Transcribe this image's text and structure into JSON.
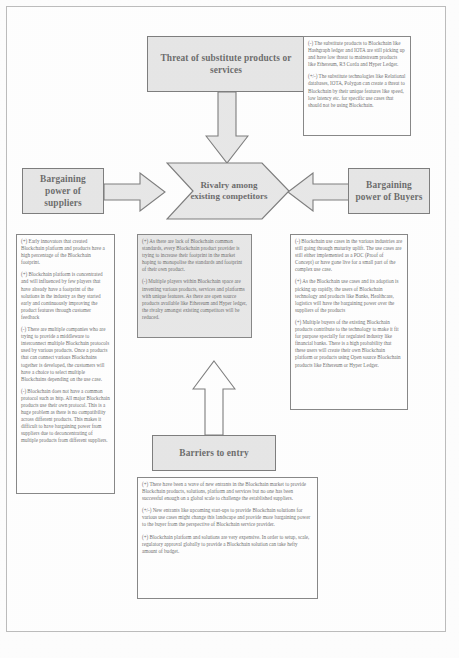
{
  "diagram": {
    "forces": {
      "substitutes": "Threat of substitute products or services",
      "suppliers": "Bargaining power of suppliers",
      "buyers": "Bargaining power of Buyers",
      "rivalry": "Rivalry among existing competitors",
      "entry": "Barriers to entry"
    },
    "colors": {
      "box_fill": "#dadada",
      "box_border": "#3b3b3b",
      "text_border": "#4a4a4a",
      "page_bg": "#ffffff"
    }
  },
  "notes": {
    "substitutes": [
      "(-) The substitute products to Blockchain like Hashgraph ledger and IOTA are still picking up and have low threat to mainstream products like Ethereum, R3 Corda and Hyper Ledger.",
      "(+/-) The substitute technologies like Relational databases, IOTA, Polygon can create a threat to Blockchain by their unique features like speed, low latency etc. for specific use cases that should not be using Blockchain."
    ],
    "suppliers": [
      "(+) Early innovators that created Blockchain platform and products have a high percentage of the Blockchain footprint.",
      "(+) Blockchain platform is concentrated and will influenced by few players that have already have a footprint of the solutions in the industry as they started early and continuously improving the product features through customer feedback",
      "(-) There are multiple companies who are trying to provide a middleware to interconnect multiple Blockchain protocols used by various products. Once a products that can connect various Blockchains together is developed, the customers will have a choice to select multiple Blockchains depending on the use case.",
      "(-) Blockchain does not have a common protocol such as http. All major Blockchain products use their own protocol. This is a huge problem as there is no compatibility across different products. This makes it difficult to have bargaining power from suppliers due to deconcentrating of multiple products from different suppliers."
    ],
    "rivalry": [
      "(+) As there are lack of Blockchain common standards, every Blockchain product provider is trying to increase their footprint in the market hoping to monopolise the standards and footprint of their own product.",
      "(-) Multiple players within Blockchain space are inventing various products, services and platforms with unique features. As there are open source products available like Ethereum and Hyper ledger, the rivalry amongst existing competitors will be reduced."
    ],
    "buyers": [
      "(-) Blockchain use cases in the various industries are still going through maturity uplift. The use cases are still either implemented as a POC (Proof of Concept) or have gone live for a small part of the complex use case.",
      "(+) As the Blockchain use cases and its adoption is picking up rapidly, the users of Blockchain technology and products like Banks, Healthcare, logistics will have the bargaining power over the suppliers of the products",
      "(+) Multiple buyers of the existing Blockchain products contribute to the technology to make it fit for purpose specially for regulated industry like financial banks. There is a high probability that these users will create their own Blockchain platform or products using Open source Blockchain products like Ethereum or Hyper Ledger."
    ],
    "entry": [
      "(+) There have been a wave of new entrants in the Blockchain market to provide Blockchain products, solutions, platform and services but no one has been successful enough on a global scale to challenge the established suppliers.",
      "(+/-) New entrants like upcoming start-ups to provide Blockchain solutions for various use cases might change this landscape and provide more bargaining power to the buyer from the perspective of Blockchain service provider.",
      "(+) Blockchain platform and solutions are very expensive. In order to setup, scale, regulatory approval globally to provide a Blockchain solution can take hefty amount of budget."
    ]
  },
  "footer": {
    "caption": ""
  }
}
